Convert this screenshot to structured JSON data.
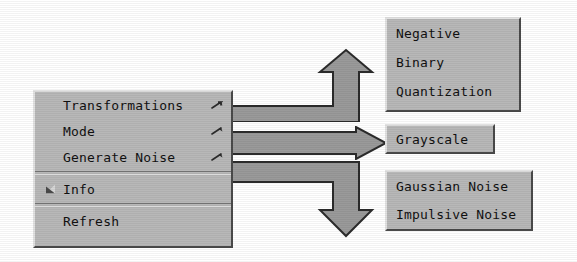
{
  "colors": {
    "menu_face": "#b8b8b8",
    "menu_light": "#e2e2e2",
    "menu_shadow": "#4a4a4a",
    "arrow_fill": "#9a9a9a",
    "arrow_outline": "#2b2b2b",
    "text": "#111111",
    "background": "#ffffff"
  },
  "main_menu": {
    "name": "context-menu",
    "items": [
      {
        "label": "Transformations",
        "has_submenu": true,
        "submenu_icon": "submenu-arrow-icon",
        "checked": false
      },
      {
        "label": "Mode",
        "has_submenu": true,
        "submenu_icon": "submenu-arrow-icon",
        "checked": false
      },
      {
        "label": "Generate Noise",
        "has_submenu": true,
        "submenu_icon": "submenu-arrow-icon",
        "checked": false
      },
      {
        "label": "Info",
        "has_submenu": false,
        "submenu_icon": "",
        "checked": true,
        "check_icon": "checkbox-indicator-icon"
      },
      {
        "label": "Refresh",
        "has_submenu": false,
        "submenu_icon": "",
        "checked": false
      }
    ],
    "separators_after": [
      2,
      3
    ]
  },
  "submenus": [
    {
      "id": "transformations",
      "parent": "Transformations",
      "items": [
        {
          "label": "Negative"
        },
        {
          "label": "Binary"
        },
        {
          "label": "Quantization"
        }
      ]
    },
    {
      "id": "mode",
      "parent": "Mode",
      "items": [
        {
          "label": "Grayscale"
        }
      ]
    },
    {
      "id": "noise",
      "parent": "Generate Noise",
      "items": [
        {
          "label": "Gaussian Noise"
        },
        {
          "label": "Impulsive Noise"
        }
      ]
    }
  ],
  "connectors": [
    {
      "id": "connector-transformations",
      "from": "Transformations",
      "to": "transformations",
      "shape": "right-up-arrow",
      "icon": "block-arrow-icon"
    },
    {
      "id": "connector-mode",
      "from": "Mode",
      "to": "mode",
      "shape": "right-arrow",
      "icon": "block-arrow-icon"
    },
    {
      "id": "connector-noise",
      "from": "Generate Noise",
      "to": "noise",
      "shape": "right-down-arrow",
      "icon": "block-arrow-icon"
    }
  ]
}
